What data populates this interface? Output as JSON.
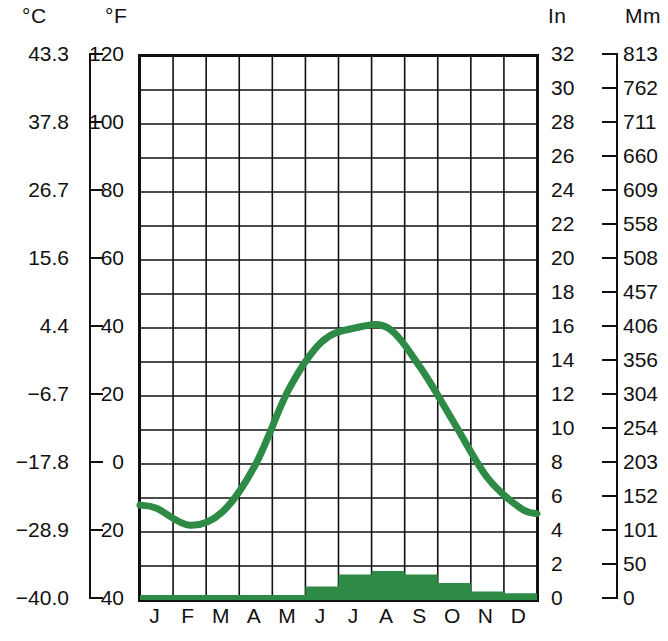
{
  "axes": {
    "celsius_title": "°C",
    "fahrenheit_title": "°F",
    "inches_title": "In",
    "mm_title": "Mm",
    "celsius_ticks": [
      "43.3",
      "37.8",
      "26.7",
      "15.6",
      "4.4",
      "−6.7",
      "−17.8",
      "−28.9",
      "−40.0"
    ],
    "fahrenheit_ticks": [
      "120",
      "100",
      "80",
      "60",
      "40",
      "20",
      "0",
      "−20",
      "−40"
    ],
    "inches_ticks": [
      "32",
      "30",
      "28",
      "26",
      "24",
      "22",
      "20",
      "18",
      "16",
      "14",
      "12",
      "10",
      "8",
      "6",
      "4",
      "2",
      "0"
    ],
    "mm_ticks": [
      "813",
      "762",
      "711",
      "660",
      "609",
      "558",
      "508",
      "457",
      "406",
      "356",
      "304",
      "254",
      "203",
      "152",
      "101",
      "50",
      "0"
    ]
  },
  "colors": {
    "series_green": "#2e8b46",
    "axis_black": "#111111",
    "grid_black": "#111111",
    "background": "#ffffff"
  },
  "chart_data": {
    "type": "line",
    "title": "",
    "subtitle": "",
    "xlabel": "",
    "ylabel": "",
    "grid": true,
    "legend": "none",
    "categories": [
      "J",
      "F",
      "M",
      "A",
      "M",
      "J",
      "J",
      "A",
      "S",
      "O",
      "N",
      "D"
    ],
    "month_names": [
      "January",
      "February",
      "March",
      "April",
      "May",
      "June",
      "July",
      "August",
      "September",
      "October",
      "November",
      "December"
    ],
    "x": [
      0,
      1,
      2,
      3,
      4,
      5,
      6,
      7,
      8,
      9,
      10,
      11
    ],
    "axis_ranges": {
      "temperature_f": [
        -40,
        120
      ],
      "temperature_c": [
        -40.0,
        43.3
      ],
      "precip_in": [
        0,
        32
      ],
      "precip_mm": [
        0,
        813
      ]
    },
    "series": [
      {
        "name": "Average temperature",
        "type": "line",
        "unit": "°F",
        "color": "#2e8b46",
        "values": [
          -13,
          -18,
          -14,
          0,
          22,
          36,
          40,
          40,
          28,
          12,
          -4,
          -13
        ]
      },
      {
        "name": "Average temperature",
        "type": "line",
        "unit": "°C",
        "color": "#2e8b46",
        "values": [
          -25.0,
          -27.8,
          -25.6,
          -17.8,
          -5.6,
          2.2,
          4.4,
          4.4,
          -2.2,
          -11.1,
          -20.0,
          -25.0
        ]
      },
      {
        "name": "Precipitation",
        "type": "bar",
        "unit": "in",
        "color": "#2e8b46",
        "values": [
          0.3,
          0.3,
          0.3,
          0.3,
          0.3,
          0.8,
          1.5,
          1.7,
          1.5,
          1.0,
          0.5,
          0.4
        ]
      },
      {
        "name": "Precipitation",
        "type": "bar",
        "unit": "mm",
        "color": "#2e8b46",
        "values": [
          8,
          8,
          8,
          8,
          8,
          20,
          38,
          43,
          38,
          25,
          13,
          10
        ]
      }
    ]
  }
}
